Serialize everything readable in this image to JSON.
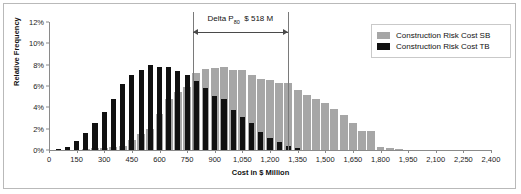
{
  "chart_data": {
    "type": "bar",
    "title": "",
    "xlabel": "Cost in $ Million",
    "ylabel": "Relative Frequency",
    "xlim": [
      0,
      2400
    ],
    "ylim": [
      0,
      12
    ],
    "xticks": [
      "0",
      "150",
      "300",
      "450",
      "600",
      "750",
      "900",
      "1,050",
      "1,200",
      "1,350",
      "1,500",
      "1,650",
      "1,800",
      "1,950",
      "2,100",
      "2,250",
      "2,400"
    ],
    "xtick_values": [
      0,
      150,
      300,
      450,
      600,
      750,
      900,
      1050,
      1200,
      1350,
      1500,
      1650,
      1800,
      1950,
      2100,
      2250,
      2400
    ],
    "yticks": [
      "0%",
      "2%",
      "4%",
      "6%",
      "8%",
      "10%",
      "12%"
    ],
    "ytick_values": [
      0,
      2,
      4,
      6,
      8,
      10,
      12
    ],
    "grid": false,
    "legend_position": "top-right",
    "bin_width": 50,
    "series": [
      {
        "name": "Construction Risk Cost SB",
        "color": "#a6a6a6",
        "x": [
          50,
          100,
          150,
          200,
          250,
          300,
          350,
          400,
          450,
          500,
          550,
          600,
          650,
          700,
          750,
          800,
          850,
          900,
          950,
          1000,
          1050,
          1100,
          1150,
          1200,
          1250,
          1300,
          1350,
          1400,
          1450,
          1500,
          1550,
          1600,
          1650,
          1700,
          1750,
          1800,
          1850,
          1900,
          1950,
          2000
        ],
        "values": [
          0,
          0,
          0,
          0.1,
          0.15,
          0.2,
          0.3,
          0.4,
          0.9,
          1.5,
          2.0,
          3.4,
          4.8,
          5.4,
          5.9,
          7.2,
          7.6,
          7.7,
          7.8,
          7.5,
          7.5,
          7.0,
          6.7,
          6.6,
          6.3,
          6.3,
          5.6,
          5.2,
          4.8,
          4.4,
          3.8,
          3.3,
          2.5,
          1.8,
          1.8,
          0.3,
          0.2,
          0.1,
          0,
          0
        ]
      },
      {
        "name": "Construction Risk Cost TB",
        "color": "#111111",
        "x": [
          50,
          100,
          150,
          200,
          250,
          300,
          350,
          400,
          450,
          500,
          550,
          600,
          650,
          700,
          750,
          800,
          850,
          900,
          950,
          1000,
          1050,
          1100,
          1150,
          1200,
          1250,
          1300,
          1350
        ],
        "values": [
          0.1,
          0.3,
          0.8,
          1.55,
          2.55,
          3.6,
          4.8,
          6.2,
          7.05,
          7.5,
          8.0,
          7.8,
          7.75,
          7.45,
          7.05,
          6.5,
          5.85,
          5.1,
          4.8,
          3.75,
          3.05,
          2.5,
          1.7,
          1.1,
          0.75,
          0.35,
          0.15
        ]
      }
    ],
    "annotation": {
      "label_prefix": "Delta P",
      "label_sub": "80",
      "label_value": "$ 518 M",
      "x_left": 780,
      "x_right": 1298
    }
  },
  "legend": {
    "items": [
      {
        "label": "Construction Risk Cost SB",
        "color": "#a6a6a6"
      },
      {
        "label": "Construction Risk Cost TB",
        "color": "#111111"
      }
    ]
  }
}
